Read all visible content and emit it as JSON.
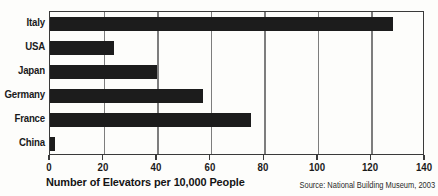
{
  "chart_data": {
    "type": "bar",
    "orientation": "horizontal",
    "title": "",
    "xlabel": "Number of Elevators per 10,000 People",
    "ylabel": "",
    "categories": [
      "Italy",
      "USA",
      "Japan",
      "Germany",
      "France",
      "China"
    ],
    "values": [
      128,
      24,
      40,
      57,
      75,
      2
    ],
    "series": [
      {
        "name": "Elevators per 10,000 people",
        "values": [
          128,
          24,
          40,
          57,
          75,
          2
        ]
      }
    ],
    "xlim": [
      0,
      140
    ],
    "xticks": [
      0,
      20,
      40,
      60,
      80,
      100,
      120,
      140
    ],
    "xtick_labels": [
      "0",
      "20",
      "40",
      "60",
      "80",
      "100",
      "120",
      "140"
    ],
    "grid": true,
    "grid_axis": "x",
    "legend": false,
    "bar_color": "#1c1c1c",
    "gridline_color": "#7d7d7d",
    "frame_color": "#3a3a3a",
    "background_color": "#fdfdfb",
    "source": "Source: National Building Museum, 2003"
  }
}
